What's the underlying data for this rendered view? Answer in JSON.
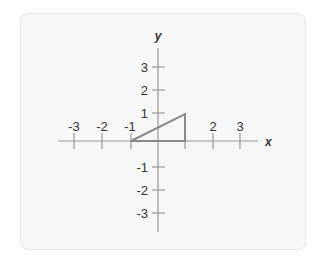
{
  "diagram": {
    "x_axis_label": "x",
    "y_axis_label": "y",
    "x_ticks": [
      {
        "label": "-3",
        "value": -3
      },
      {
        "label": "-2",
        "value": -2
      },
      {
        "label": "-1",
        "value": -1
      },
      {
        "label": "2",
        "value": 2
      },
      {
        "label": "3",
        "value": 3
      }
    ],
    "y_ticks": [
      {
        "label": "3",
        "value": 3
      },
      {
        "label": "2",
        "value": 2
      },
      {
        "label": "1",
        "value": 1
      },
      {
        "label": "-1",
        "value": -1
      },
      {
        "label": "-2",
        "value": -2
      },
      {
        "label": "-3",
        "value": -3
      }
    ],
    "shape": {
      "type": "right-triangle",
      "vertices": [
        [
          -1,
          0
        ],
        [
          1,
          0
        ],
        [
          1,
          1
        ]
      ],
      "stroke_color": "#8a8a8a"
    },
    "axis_color": "#9a9a9a"
  }
}
